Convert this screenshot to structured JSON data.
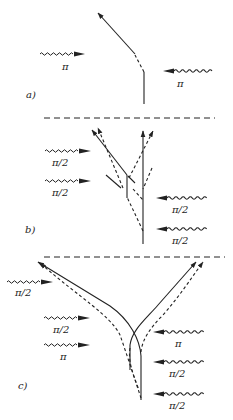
{
  "figure": {
    "panels": [
      {
        "id": "a",
        "label": "a)",
        "pulses": [
          {
            "side": "left",
            "direction": "right",
            "label": "π"
          },
          {
            "side": "right",
            "direction": "left",
            "label": "π"
          }
        ]
      },
      {
        "id": "b",
        "label": "b)",
        "pulses": [
          {
            "side": "left",
            "direction": "right",
            "label": "π/2"
          },
          {
            "side": "left",
            "direction": "right",
            "label": "π/2"
          },
          {
            "side": "right",
            "direction": "left",
            "label": "π/2"
          },
          {
            "side": "right",
            "direction": "left",
            "label": "π/2"
          }
        ]
      },
      {
        "id": "c",
        "label": "c)",
        "pulses": [
          {
            "side": "left",
            "direction": "right",
            "label": "π/2"
          },
          {
            "side": "left",
            "direction": "right",
            "label": "π/2"
          },
          {
            "side": "left",
            "direction": "right",
            "label": "π"
          },
          {
            "side": "right",
            "direction": "left",
            "label": "π"
          },
          {
            "side": "right",
            "direction": "left",
            "label": "π/2"
          },
          {
            "side": "right",
            "direction": "left",
            "label": "π/2"
          }
        ]
      }
    ],
    "legend": {
      "solid_line": "trajectory",
      "dashed_line": "alternate trajectory",
      "dashed_horizontal": "panel separator"
    },
    "colors": {
      "ink": "#222222",
      "background": "#ffffff"
    }
  }
}
